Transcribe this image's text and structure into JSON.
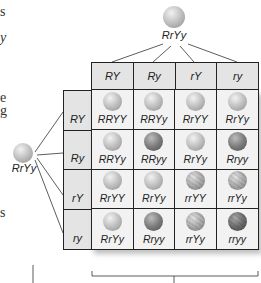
{
  "left_margin_fragments": [
    {
      "text": "s",
      "top": 4
    },
    {
      "text": "y",
      "top": 30
    },
    {
      "text": "e",
      "top": 90
    },
    {
      "text": "g",
      "top": 103
    },
    {
      "text": "s",
      "top": 205
    }
  ],
  "top_parent": {
    "genotype": "RrYy",
    "pea": "yellow-round"
  },
  "left_parent": {
    "genotype": "RrYy",
    "pea": "yellow-round"
  },
  "column_gametes": [
    "RY",
    "Ry",
    "rY",
    "ry"
  ],
  "row_gametes": [
    "RY",
    "Ry",
    "rY",
    "ry"
  ],
  "cells": [
    [
      {
        "genotype": "RRYY",
        "pea": "yr"
      },
      {
        "genotype": "RRYy",
        "pea": "yr"
      },
      {
        "genotype": "RrYY",
        "pea": "yr"
      },
      {
        "genotype": "RrYy",
        "pea": "yr"
      }
    ],
    [
      {
        "genotype": "RRYy",
        "pea": "yr"
      },
      {
        "genotype": "RRyy",
        "pea": "gr"
      },
      {
        "genotype": "RrYy",
        "pea": "yr"
      },
      {
        "genotype": "Rryy",
        "pea": "gr"
      }
    ],
    [
      {
        "genotype": "RrYY",
        "pea": "yr"
      },
      {
        "genotype": "RrYy",
        "pea": "yr"
      },
      {
        "genotype": "rrYY",
        "pea": "yw"
      },
      {
        "genotype": "rrYy",
        "pea": "yw"
      }
    ],
    [
      {
        "genotype": "RrYy",
        "pea": "yr"
      },
      {
        "genotype": "Rryy",
        "pea": "gr"
      },
      {
        "genotype": "rrYy",
        "pea": "yw"
      },
      {
        "genotype": "rryy",
        "pea": "gw"
      }
    ]
  ]
}
